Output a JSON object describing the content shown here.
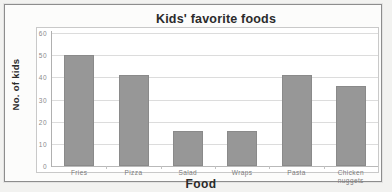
{
  "chart_data": {
    "type": "bar",
    "title": "Kids' favorite foods",
    "xlabel": "Food",
    "ylabel": "No. of kids",
    "categories": [
      "Fries",
      "Pizza",
      "Salad",
      "Wraps",
      "Pasta",
      "Chicken nuggets"
    ],
    "values": [
      50,
      41,
      16,
      16,
      41,
      36
    ],
    "ylim": [
      0,
      60
    ],
    "yticks": [
      0,
      10,
      20,
      30,
      40,
      50,
      60
    ],
    "ytick_labels": [
      "0",
      "10",
      "20",
      "30",
      "40",
      "50",
      "60"
    ],
    "grid": true,
    "legend": false,
    "series": [
      {
        "name": "No. of kids",
        "values": [
          50,
          41,
          16,
          16,
          41,
          36
        ]
      }
    ],
    "colors": {
      "bar_fill": "#979797",
      "bar_edge": "#8a8a8a",
      "gridline": "#dcdcdc",
      "axis": "#b0b0b0",
      "text": "#2b2b2b",
      "tick_text": "#8a8a8a",
      "plot_background": "#ffffff",
      "page_background": "#f2f2f0"
    }
  }
}
